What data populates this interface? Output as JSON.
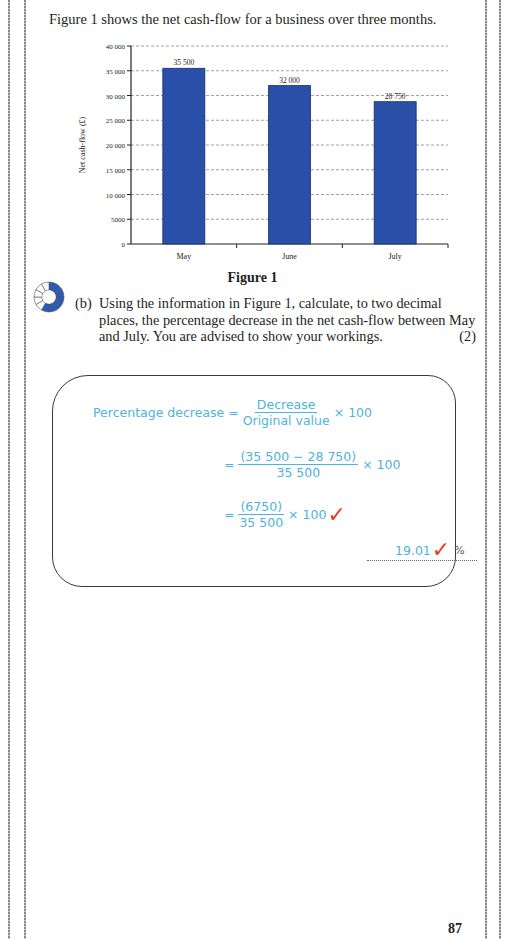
{
  "page": {
    "intro_text": "Figure 1 shows the net cash-flow for a business over three months.",
    "figure_caption": "Figure 1",
    "page_number": "87"
  },
  "chart_data": {
    "type": "bar",
    "title": "",
    "categories": [
      "May",
      "June",
      "July"
    ],
    "values": [
      35500,
      32000,
      28750
    ],
    "value_labels": [
      "35 500",
      "32 000",
      "28 750"
    ],
    "xlabel": "",
    "ylabel": "Net cash-flow (£)",
    "ylim": [
      0,
      40000
    ],
    "yticks": [
      "0",
      "5000",
      "10 000",
      "15 000",
      "20 000",
      "25 000",
      "30 000",
      "35 000",
      "40 000"
    ],
    "grid": "dashed horizontal",
    "bar_color": "#2a4fa8",
    "legend": "none"
  },
  "question": {
    "icon": "difficulty-dial-icon",
    "label": "(b)",
    "text": "Using the information in Figure 1, calculate, to two decimal places, the percentage decrease in the net cash-flow between May and July. You are advised to show your workings.",
    "marks": "(2)"
  },
  "answer": {
    "line1": {
      "lhs": "Percentage decrease =",
      "num": "Decrease",
      "den": "Original value",
      "mult": "× 100"
    },
    "line2": {
      "eq": "=",
      "num": "(35 500 − 28 750)",
      "den": "35 500",
      "mult": "× 100"
    },
    "line3": {
      "eq": "=",
      "num": "(6750)",
      "den": "35 500",
      "mult": "× 100",
      "tick": "✓"
    },
    "result": {
      "value": "19.01",
      "tick": "✓",
      "unit": "%"
    },
    "colors": {
      "handwriting": "#4fb3e0",
      "tick": "#e53a1e"
    }
  }
}
